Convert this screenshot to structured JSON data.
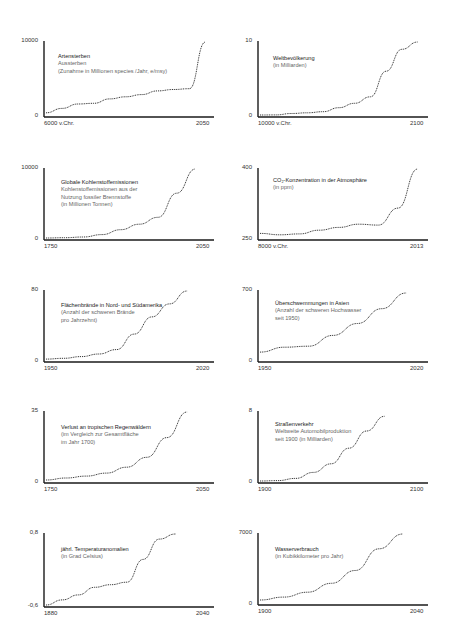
{
  "chart_data": [
    {
      "type": "line",
      "title": "Artensterben",
      "subtitle": [
        "Aussterben",
        "(Zunahme in Millionen species /Jahr, e/msy)"
      ],
      "x_start_label": "6000 v.Chr.",
      "x_end_label": "2050",
      "y_min_label": "0",
      "y_max_label": "10000",
      "ylim": [
        0,
        10000
      ],
      "x": [
        -6000,
        -4000,
        -2000,
        -1000,
        -950,
        0,
        1000,
        1900,
        2000,
        2020,
        2050
      ],
      "values": [
        300,
        900,
        1500,
        1600,
        2200,
        2500,
        2800,
        3300,
        3500,
        3600,
        10000
      ]
    },
    {
      "type": "line",
      "title": "Weltbevölkerung",
      "subtitle": [
        "(in Milliarden)"
      ],
      "x_start_label": "10000 v.Chr.",
      "x_end_label": "2100",
      "y_min_label": "0",
      "y_max_label": "10",
      "ylim": [
        0,
        10
      ],
      "x": [
        -10000,
        -5000,
        0,
        1000,
        1500,
        1800,
        1900,
        1950,
        2000,
        2050,
        2100
      ],
      "values": [
        0,
        0.01,
        0.2,
        0.3,
        0.45,
        1,
        1.6,
        2.5,
        6,
        9,
        10
      ]
    },
    {
      "type": "line",
      "title": "Globale Kohlenstoffemissionen",
      "subtitle": [
        "Kohlenstoffemissionen aus der",
        "Nutzung fossiler Brennstoffe",
        "(in Millionen Tonnen)"
      ],
      "x_start_label": "1750",
      "x_end_label": "2050",
      "y_min_label": "0",
      "y_max_label": "10000",
      "ylim": [
        0,
        10000
      ],
      "x": [
        1750,
        1800,
        1850,
        1900,
        1950,
        1980,
        2000,
        2020,
        2050
      ],
      "values": [
        0,
        50,
        150,
        500,
        1200,
        2000,
        3000,
        6500,
        10000
      ]
    },
    {
      "type": "line",
      "title": "CO₂-Konzentration in der Atmosphäre",
      "subtitle": [
        "(in ppm)"
      ],
      "x_start_label": "8000 v.Chr.",
      "x_end_label": "2013",
      "y_min_label": "250",
      "y_max_label": "400",
      "ylim": [
        250,
        400
      ],
      "x": [
        -8000,
        -6000,
        -4000,
        0,
        1000,
        1800,
        1900,
        1960,
        2013
      ],
      "values": [
        260,
        257,
        259,
        267,
        273,
        280,
        278,
        315,
        400
      ]
    },
    {
      "type": "line",
      "title": "Flächenbrände in Nord- und Südamerika",
      "subtitle": [
        "(Anzahl der schweren Brände",
        "pro Jahrzehnt)"
      ],
      "x_start_label": "1950",
      "x_end_label": "2020",
      "y_min_label": "0",
      "y_max_label": "80",
      "ylim": [
        0,
        80
      ],
      "x": [
        1950,
        1970,
        1980,
        1990,
        2000,
        2005,
        2010,
        2015,
        2020
      ],
      "values": [
        1,
        2,
        4,
        7,
        12,
        30,
        50,
        65,
        80
      ]
    },
    {
      "type": "line",
      "title": "Überschwemmungen in Asien",
      "subtitle": [
        "(Anzahl der schweren Hochwasser",
        "seit 1950)"
      ],
      "x_start_label": "1950",
      "x_end_label": "2020",
      "y_min_label": "0",
      "y_max_label": "700",
      "ylim": [
        0,
        700
      ],
      "x": [
        1950,
        1965,
        1980,
        1990,
        2000,
        2010,
        2020
      ],
      "values": [
        80,
        130,
        140,
        250,
        370,
        520,
        680
      ]
    },
    {
      "type": "line",
      "title": "Verlust an tropischen Regenwäldern",
      "subtitle": [
        "(im Vergleich zur Gesamtfläche",
        "im Jahr 1700)"
      ],
      "x_start_label": "1750",
      "x_end_label": "2050",
      "y_min_label": "0",
      "y_max_label": "35",
      "ylim": [
        0,
        35
      ],
      "x": [
        1750,
        1850,
        1900,
        1950,
        1980,
        2000,
        2020,
        2040
      ],
      "values": [
        0.5,
        1.5,
        2.5,
        4,
        7,
        12,
        22,
        35
      ]
    },
    {
      "type": "line",
      "title": "Straßenverkehr",
      "subtitle": [
        "Weltweite Automobilproduktion",
        "seit 1900 (in Milliarden)"
      ],
      "x_start_label": "1900",
      "x_end_label": "2100",
      "y_min_label": "0",
      "y_max_label": "8",
      "ylim": [
        0,
        8
      ],
      "x": [
        1900,
        1920,
        1950,
        1980,
        2000,
        2020,
        2040,
        2060
      ],
      "values": [
        0,
        0.05,
        0.3,
        1.0,
        2.0,
        3.8,
        5.8,
        7.5
      ]
    },
    {
      "type": "line",
      "title": "jährl. Temperaturanomalien",
      "subtitle": [
        "(in Grad Celsius)"
      ],
      "x_start_label": "1880",
      "x_end_label": "2040",
      "y_min_label": "-0,6",
      "y_max_label": "0,8",
      "ylim": [
        -0.6,
        0.8
      ],
      "x": [
        1880,
        1900,
        1920,
        1940,
        1960,
        1975,
        1990,
        2005,
        2020
      ],
      "values": [
        -0.6,
        -0.5,
        -0.4,
        -0.25,
        -0.2,
        -0.15,
        0.3,
        0.7,
        0.8
      ]
    },
    {
      "type": "line",
      "title": "Wasserverbrauch",
      "subtitle": [
        "(in Kubikkilometer pro Jahr)"
      ],
      "x_start_label": "1900",
      "x_end_label": "2040",
      "y_min_label": "0",
      "y_max_label": "7000",
      "ylim": [
        0,
        7000
      ],
      "x": [
        1900,
        1925,
        1950,
        1975,
        2000,
        2025,
        2035
      ],
      "values": [
        300,
        600,
        1100,
        2000,
        3300,
        5500,
        7000
      ]
    }
  ],
  "style": {
    "axis_color": "#1a1a1a",
    "line_color": "#333333",
    "background": "#ffffff"
  }
}
